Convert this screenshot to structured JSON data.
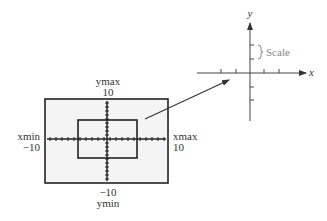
{
  "window": {
    "label_ymax_name": "ymax",
    "label_ymax_value": "10",
    "label_ymin_value": "−10",
    "label_ymin_name": "ymin",
    "label_xmin_name": "xmin",
    "label_xmin_value": "−10",
    "label_xmax_name": "xmax",
    "label_xmax_value": "10",
    "screen_fill": "#f4f4f4",
    "border_color": "#222222"
  },
  "coordinate_plane": {
    "x_axis_label": "x",
    "y_axis_label": "y",
    "scale_label": "Scale",
    "axis_color": "#444444",
    "scale_color": "#888888"
  }
}
